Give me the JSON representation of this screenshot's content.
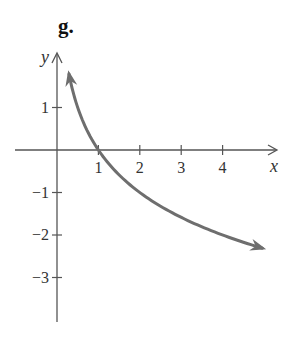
{
  "figure": {
    "label": "g."
  },
  "chart_data": {
    "type": "line",
    "title": "g.",
    "xlabel": "x",
    "ylabel": "y",
    "function": "y = -log2(x)",
    "xlim": [
      -1,
      5.2
    ],
    "ylim": [
      -4,
      2.3
    ],
    "x_ticks": [
      1,
      2,
      3,
      4
    ],
    "x_tick_labels": [
      "1",
      "2",
      "3",
      "4"
    ],
    "y_ticks": [
      1,
      -1,
      -2,
      -3
    ],
    "y_tick_labels": [
      "1",
      "-1",
      "-2",
      "-3"
    ],
    "grid": false,
    "legend": null,
    "series": [
      {
        "name": "curve",
        "color": "#6e6e6e",
        "arrows": "both ends",
        "x": [
          0.29,
          0.5,
          0.75,
          1,
          1.5,
          2,
          2.5,
          3,
          3.5,
          4,
          4.5,
          4.96
        ],
        "y": [
          1.79,
          1,
          0.42,
          0,
          -0.58,
          -1,
          -1.32,
          -1.58,
          -1.81,
          -2,
          -2.17,
          -2.31
        ]
      }
    ],
    "annotations": []
  },
  "style": {
    "axis_color": "#555555",
    "curve_color": "#6e6e6e"
  }
}
